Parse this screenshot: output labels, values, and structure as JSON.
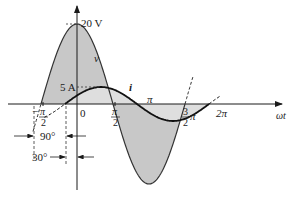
{
  "diagram": {
    "type": "phasor-waveform",
    "voltage": {
      "label": "v",
      "peak_label": "20 V",
      "peak": 20,
      "phase_deg": 90
    },
    "current": {
      "label": "i",
      "peak_label": "5 A",
      "peak": 5,
      "phase_deg": 30
    },
    "axis_labels": {
      "horizontal": "ωt",
      "neg_half_pi_num": "π",
      "neg_half_pi_den": "2",
      "neg_sign": "−",
      "zero": "0",
      "half_pi_num": "π",
      "half_pi_den": "2",
      "pi": "π",
      "three_half_num": "3",
      "three_half_den": "2",
      "three_half_pi": "π",
      "two_pi": "2π"
    },
    "angle_annotations": {
      "voltage_lead": "90°",
      "current_lead": "30°"
    },
    "colors": {
      "fill": "#c8c8c8",
      "line": "#1a1a1a",
      "background": "#ffffff"
    }
  }
}
